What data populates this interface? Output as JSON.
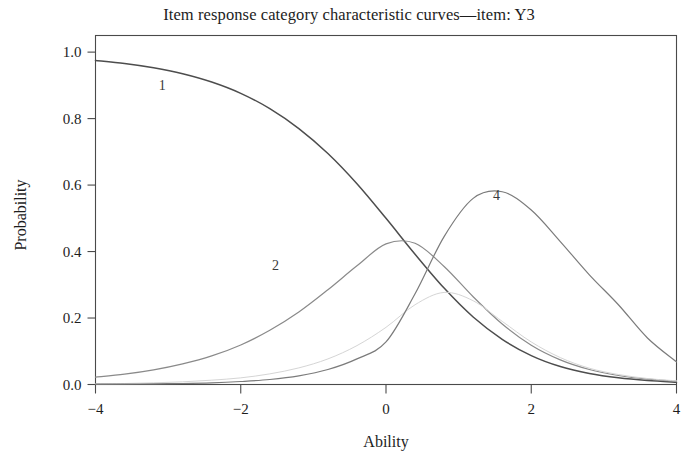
{
  "chart_data": {
    "type": "line",
    "title": "Item response category characteristic curves—item: Y3",
    "xlabel": "Ability",
    "ylabel": "Probability",
    "xlim": [
      -4,
      4
    ],
    "ylim": [
      0,
      1.05
    ],
    "xticks": [
      -4,
      -2,
      0,
      2,
      4
    ],
    "xtick_labels": [
      "−4",
      "−2",
      "0",
      "2",
      "4"
    ],
    "yticks": [
      0.0,
      0.2,
      0.4,
      0.6,
      0.8,
      1.0
    ],
    "ytick_labels": [
      "0.0",
      "0.2",
      "0.4",
      "0.6",
      "0.8",
      "1.0"
    ],
    "grid": false,
    "legend": "inline-curve-labels",
    "model": "graded-response",
    "discrimination": 1.15,
    "thresholds": [
      -0.85,
      0.0,
      0.6
    ],
    "series": [
      {
        "name": "1",
        "label": "1",
        "color": "#4d4d4d",
        "width": 1.5,
        "label_x": -3.08,
        "label_y": 0.885,
        "x": [
          -4.0,
          -3.6,
          -3.2,
          -2.8,
          -2.4,
          -2.0,
          -1.6,
          -1.2,
          -0.8,
          -0.4,
          0.0,
          0.4,
          0.8,
          1.2,
          1.6,
          2.0,
          2.4,
          2.8,
          3.2,
          3.6,
          4.0
        ],
        "y": [
          0.975,
          0.966,
          0.953,
          0.935,
          0.91,
          0.876,
          0.83,
          0.77,
          0.695,
          0.604,
          0.5,
          0.392,
          0.29,
          0.203,
          0.136,
          0.087,
          0.054,
          0.033,
          0.02,
          0.012,
          0.007
        ]
      },
      {
        "name": "2",
        "label": "2",
        "color": "#8a8a8a",
        "width": 1.2,
        "label_x": -1.52,
        "label_y": 0.345,
        "x": [
          -4.0,
          -3.6,
          -3.2,
          -2.8,
          -2.4,
          -2.0,
          -1.6,
          -1.2,
          -0.8,
          -0.4,
          0.0,
          0.4,
          0.8,
          1.2,
          1.6,
          2.0,
          2.4,
          2.8,
          3.2,
          3.6,
          4.0
        ],
        "y": [
          0.022,
          0.031,
          0.044,
          0.062,
          0.086,
          0.119,
          0.163,
          0.218,
          0.285,
          0.357,
          0.423,
          0.425,
          0.355,
          0.264,
          0.182,
          0.118,
          0.074,
          0.045,
          0.027,
          0.016,
          0.01
        ]
      },
      {
        "name": "3",
        "label": "3",
        "color": "#d5d5d5",
        "width": 1.0,
        "label_x": null,
        "label_y": null,
        "x": [
          -4.0,
          -3.6,
          -3.2,
          -2.8,
          -2.4,
          -2.0,
          -1.6,
          -1.2,
          -0.8,
          -0.4,
          0.0,
          0.4,
          0.8,
          1.2,
          1.6,
          2.0,
          2.4,
          2.8,
          3.2,
          3.6,
          4.0
        ],
        "y": [
          0.002,
          0.003,
          0.005,
          0.008,
          0.013,
          0.02,
          0.032,
          0.05,
          0.077,
          0.117,
          0.172,
          0.24,
          0.277,
          0.252,
          0.19,
          0.128,
          0.081,
          0.049,
          0.03,
          0.018,
          0.011
        ]
      },
      {
        "name": "4",
        "label": "4",
        "color": "#7b7b7b",
        "width": 1.2,
        "label_x": 1.52,
        "label_y": 0.555,
        "x": [
          -4.0,
          -3.6,
          -3.2,
          -2.8,
          -2.4,
          -2.0,
          -1.6,
          -1.2,
          -0.8,
          -0.4,
          0.0,
          0.4,
          0.8,
          1.2,
          1.6,
          2.0,
          2.4,
          2.8,
          3.2,
          3.6,
          4.0
        ],
        "y": [
          0.001,
          0.001,
          0.002,
          0.003,
          0.005,
          0.009,
          0.015,
          0.026,
          0.045,
          0.077,
          0.128,
          0.273,
          0.445,
          0.56,
          0.58,
          0.525,
          0.43,
          0.33,
          0.24,
          0.14,
          0.068
        ]
      }
    ]
  }
}
